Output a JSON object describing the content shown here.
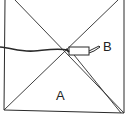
{
  "diagram": {
    "labels": {
      "a": "A",
      "b": "B"
    },
    "colors": {
      "line": "#2a2a2a",
      "background": "#ffffff"
    }
  }
}
